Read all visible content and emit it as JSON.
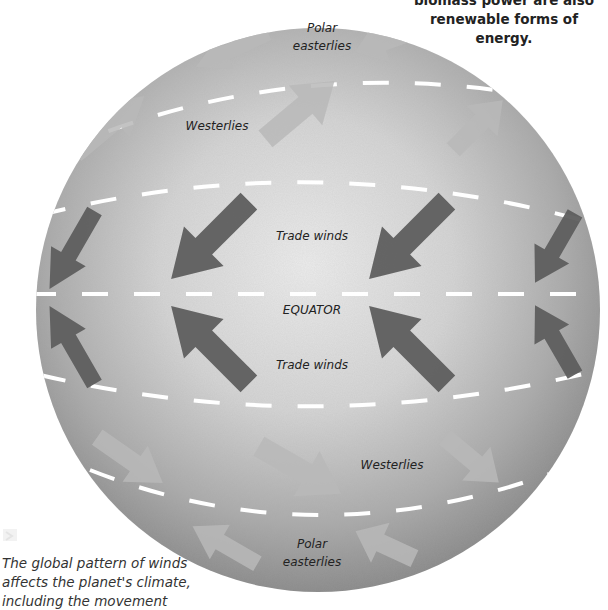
{
  "top_note": {
    "line1": "biomass power are also",
    "line2": "renewable forms of energy."
  },
  "caption": {
    "line1": "The global pattern of winds",
    "line2": "affects the planet's climate,",
    "line3": "including the movement"
  },
  "globe": {
    "labels": {
      "polar_easterlies_north_1": "Polar",
      "polar_easterlies_north_2": "easterlies",
      "westerlies_north": "Westerlies",
      "trade_winds_north": "Trade winds",
      "equator": "EQUATOR",
      "trade_winds_south": "Trade winds",
      "westerlies_south": "Westerlies",
      "polar_easterlies_south_1": "Polar",
      "polar_easterlies_south_2": "easterlies"
    },
    "wind_bands": [
      {
        "name": "Polar easterlies (north)",
        "direction": "toward south-west"
      },
      {
        "name": "Westerlies (north)",
        "direction": "toward north-east"
      },
      {
        "name": "Trade winds (north)",
        "direction": "toward south-west"
      },
      {
        "name": "Trade winds (south)",
        "direction": "toward north-west"
      },
      {
        "name": "Westerlies (south)",
        "direction": "toward south-east"
      },
      {
        "name": "Polar easterlies (south)",
        "direction": "toward north-west"
      }
    ],
    "colors": {
      "globe_light": "#e6e6e6",
      "globe_dark": "#8c8c8c",
      "arrow_dark": "#5e5e5e",
      "arrow_light": "#b9b9b9",
      "dash": "#ffffff"
    }
  }
}
